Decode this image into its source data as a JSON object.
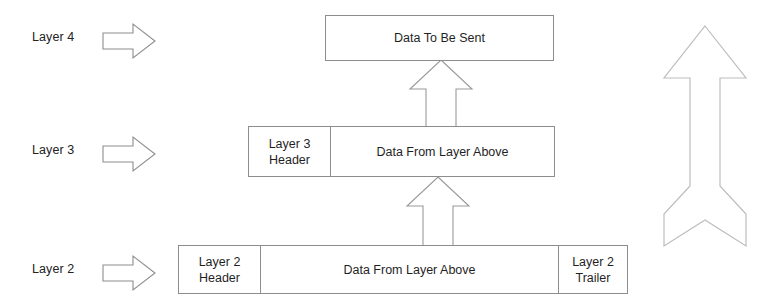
{
  "diagram": {
    "stroke_color": "#8d8d8d",
    "text_color": "#1f1f1f",
    "background": "#ffffff"
  },
  "layer_labels": [
    {
      "text": "Layer 4",
      "arrow": "right-arrow-icon"
    },
    {
      "text": "Layer 3",
      "arrow": "right-arrow-icon"
    },
    {
      "text": "Layer 2",
      "arrow": "right-arrow-icon"
    }
  ],
  "rows": {
    "layer4": {
      "cells": [
        {
          "label": "Data To Be Sent"
        }
      ]
    },
    "layer3": {
      "cells": [
        {
          "label": "Layer 3\nHeader"
        },
        {
          "label": "Data From Layer Above"
        }
      ]
    },
    "layer2": {
      "cells": [
        {
          "label": "Layer 2\nHeader"
        },
        {
          "label": "Data From Layer Above"
        },
        {
          "label": "Layer 2\nTrailer"
        }
      ]
    }
  },
  "connectors": [
    {
      "name": "up-arrow-layer3-to-layer4",
      "direction": "up"
    },
    {
      "name": "up-arrow-layer2-to-layer3",
      "direction": "up"
    }
  ],
  "flow_arrow": {
    "name": "large-up-arrow",
    "direction": "up"
  }
}
